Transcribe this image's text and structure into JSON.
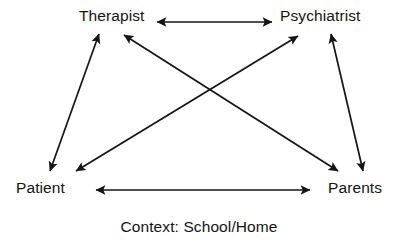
{
  "diagram": {
    "title": "Context: School/Home",
    "background_color": "#ffffff",
    "line_color": "#141414",
    "nodes": [
      {
        "id": "therapist",
        "label": "Therapist",
        "position": "top-left"
      },
      {
        "id": "psychiatrist",
        "label": "Psychiatrist",
        "position": "top-right"
      },
      {
        "id": "patient",
        "label": "Patient",
        "position": "bottom-left"
      },
      {
        "id": "parents",
        "label": "Parents",
        "position": "bottom-right"
      }
    ],
    "caption": "Context: School/Home",
    "edges": [
      {
        "id": "therapist-psychiatrist",
        "from": "therapist",
        "to": "psychiatrist",
        "arrows": "both",
        "x1": 157,
        "y1": 22,
        "x2": 272,
        "y2": 22
      },
      {
        "id": "patient-parents",
        "from": "patient",
        "to": "parents",
        "arrows": "both",
        "x1": 96,
        "y1": 190,
        "x2": 310,
        "y2": 190
      },
      {
        "id": "patient-therapist",
        "from": "patient",
        "to": "therapist",
        "arrows": "both",
        "x1": 99,
        "y1": 34,
        "x2": 50,
        "y2": 171
      },
      {
        "id": "psychiatrist-parents",
        "from": "psychiatrist",
        "to": "parents",
        "arrows": "both",
        "x1": 331,
        "y1": 34,
        "x2": 363,
        "y2": 171
      },
      {
        "id": "parents-therapist",
        "from": "parents",
        "to": "therapist",
        "arrows": "both",
        "x1": 124,
        "y1": 35,
        "x2": 338,
        "y2": 171
      },
      {
        "id": "patient-psychiatrist",
        "from": "patient",
        "to": "psychiatrist",
        "arrows": "both",
        "x1": 298,
        "y1": 36,
        "x2": 76,
        "y2": 171
      }
    ]
  }
}
